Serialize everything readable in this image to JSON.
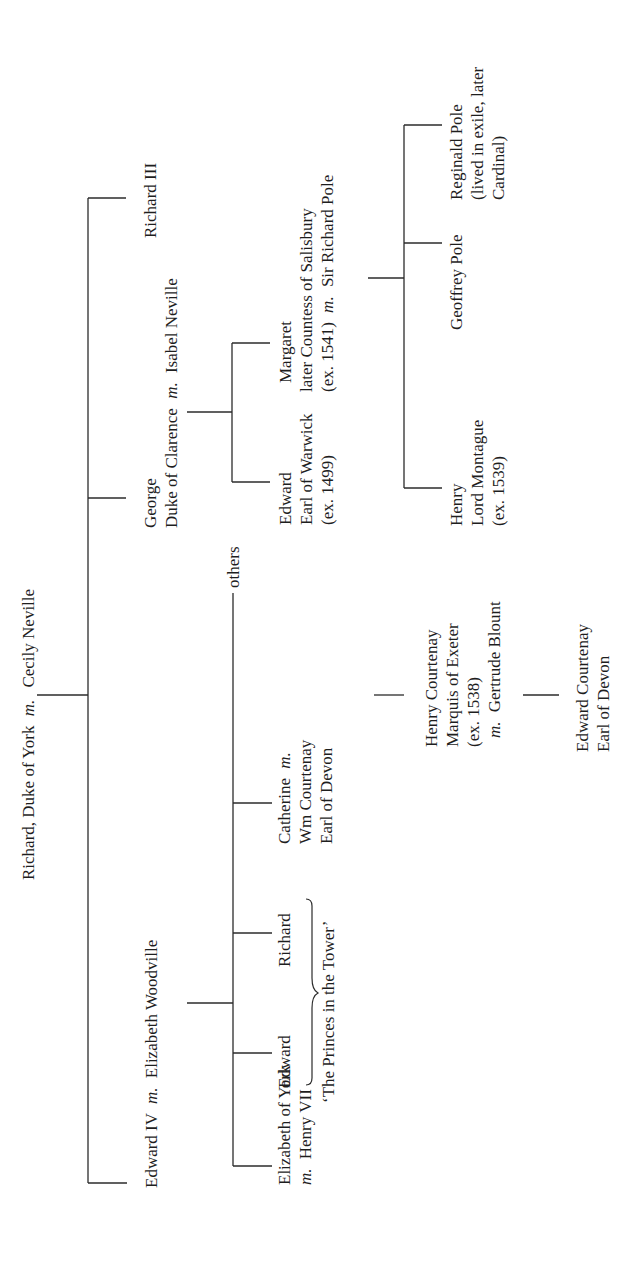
{
  "diagram": {
    "type": "family-tree",
    "orientation": "rotated-90-ccw",
    "root": {
      "name": "Richard, Duke of York",
      "marriage_marker": "m.",
      "spouse": "Cecily Neville"
    },
    "children": {
      "edward_iv": {
        "name": "Edward IV",
        "marriage_marker": "m.",
        "spouse": "Elizabeth Woodville"
      },
      "george": {
        "line1": "George",
        "line2_a": "Duke of Clarence",
        "marriage_marker": "m.",
        "spouse": "Isabel Neville"
      },
      "richard_iii": {
        "name": "Richard III"
      }
    },
    "edward_iv_children": {
      "elizabeth": {
        "line1": "Elizabeth of York",
        "marriage_marker": "m.",
        "spouse": "Henry VII"
      },
      "edward": {
        "name": "Edward"
      },
      "richard": {
        "name": "Richard"
      },
      "princes_label": "‘The Princes in the Tower’",
      "catherine": {
        "line1_a": "Catherine",
        "marriage_marker": "m.",
        "line2": "Wm Courtenay",
        "line3": "Earl of Devon"
      },
      "others": {
        "name": "others"
      }
    },
    "courtenay_line": {
      "henry": {
        "line1": "Henry Courtenay",
        "line2": "Marquis of Exeter",
        "line3": "(ex. 1538)",
        "marriage_marker": "m.",
        "spouse": "Gertrude Blount"
      },
      "edward": {
        "line1": "Edward Courtenay",
        "line2": "Earl of Devon"
      }
    },
    "clarence_children": {
      "edward": {
        "line1": "Edward",
        "line2": "Earl of Warwick",
        "line3": "(ex. 1499)"
      },
      "margaret": {
        "line1": "Margaret",
        "line2": "later Countess of Salisbury",
        "line3_a": "(ex. 1541)",
        "marriage_marker": "m.",
        "spouse": "Sir Richard Pole"
      }
    },
    "pole_children": {
      "henry": {
        "line1": "Henry",
        "line2": "Lord Montague",
        "line3": "(ex. 1539)"
      },
      "geoffrey": {
        "name": "Geoffrey Pole"
      },
      "reginald": {
        "line1": "Reginald Pole",
        "line2": "(lived in exile, later",
        "line3": "Cardinal)"
      }
    },
    "colors": {
      "ink": "#1e1e1e",
      "background": "#ffffff"
    }
  }
}
